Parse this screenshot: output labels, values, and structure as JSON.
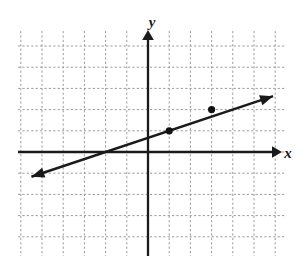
{
  "figure": {
    "title": "",
    "background_color": "#ffffff",
    "grid_color": "#9a9a9a",
    "axis_color": "#1a1a1a",
    "line_color": "#1a1a1a",
    "point_color": "#111111"
  },
  "axes": {
    "x_label": "x",
    "y_label": "y",
    "x_label_name": "x-axis-label",
    "y_label_name": "y-axis-label",
    "grid": "on",
    "grid_style": "dotted",
    "tick_labels": [],
    "origin_px": [
      148,
      152
    ],
    "unit_px": 21.2
  },
  "chart_data": {
    "type": "line",
    "title": "",
    "xlabel": "x",
    "ylabel": "y",
    "xlim": [
      -6,
      6.5
    ],
    "ylim": [
      -5.7,
      5.7
    ],
    "grid": true,
    "legend": "none",
    "series": [
      {
        "name": "line",
        "type": "line",
        "slope": 0.3333,
        "intercept": 0.6667,
        "x": [
          -5.5,
          5.9
        ],
        "y": [
          -1.167,
          2.633
        ],
        "arrow_start": true,
        "arrow_end": true,
        "points": [
          {
            "x": 1,
            "y": 1,
            "marked": true
          },
          {
            "x": 3,
            "y": 2,
            "marked": true
          }
        ]
      }
    ]
  }
}
